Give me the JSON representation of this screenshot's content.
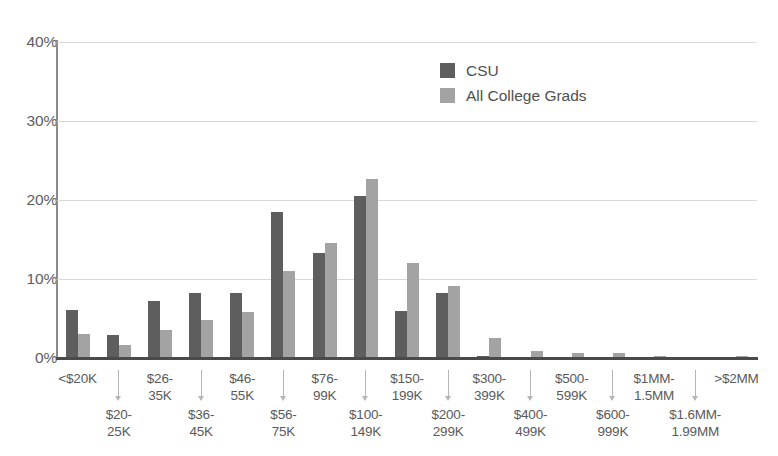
{
  "chart_data": {
    "type": "bar",
    "title": "",
    "xlabel": "",
    "ylabel": "",
    "ylim": [
      0,
      40
    ],
    "yticks": [
      "0%",
      "10%",
      "20%",
      "30%",
      "40%"
    ],
    "ytick_values": [
      0,
      10,
      20,
      30,
      40
    ],
    "grid": true,
    "legend_position": "top-center-right",
    "categories": [
      "<$20K",
      "$20-\n25K",
      "$26-\n35K",
      "$36-\n45K",
      "$46-\n55K",
      "$56-\n75K",
      "$76-\n99K",
      "$100-\n149K",
      "$150-\n199K",
      "$200-\n299K",
      "$300-\n399K",
      "$400-\n499K",
      "$500-\n599K",
      "$600-\n999K",
      "$1MM-\n1.5MM",
      "$1.6MM-\n1.99MM",
      ">$2MM"
    ],
    "series": [
      {
        "name": "CSU",
        "color": "#5e5e5e",
        "values": [
          6.1,
          2.9,
          7.2,
          8.2,
          8.2,
          18.5,
          13.3,
          20.5,
          6.0,
          8.2,
          0.2,
          0.1,
          0.1,
          0.1,
          0.1,
          0.0,
          0.0
        ]
      },
      {
        "name": "All College Grads",
        "color": "#a3a3a3",
        "values": [
          3.0,
          1.7,
          3.5,
          4.8,
          5.8,
          11.0,
          14.5,
          22.7,
          12.0,
          9.1,
          2.5,
          0.9,
          0.6,
          0.6,
          0.3,
          0.1,
          0.3
        ]
      }
    ]
  },
  "legend": {
    "items": [
      {
        "label": "CSU",
        "color": "#5e5e5e"
      },
      {
        "label": "All College Grads",
        "color": "#a3a3a3"
      }
    ]
  }
}
